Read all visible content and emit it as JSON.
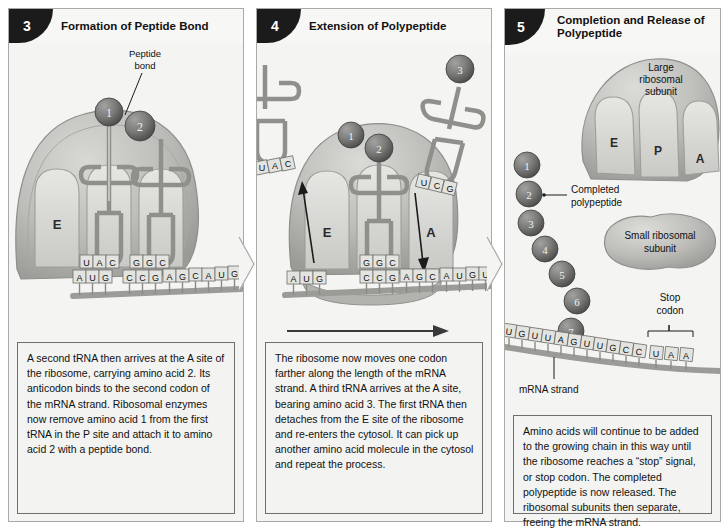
{
  "figure": {
    "colors": {
      "ribosome_fill": "#b9b9b6",
      "ribosome_dark": "#8e8e8a",
      "amino_acid": "#6d6d6d",
      "mrna_strand": "#9b9b97",
      "panel_bg": "#f4f4f2",
      "border": "#6f6f6f",
      "badge": "#1b1b1b",
      "text": "#111111"
    }
  },
  "panels": [
    {
      "number": "3",
      "title": "Formation of Peptide Bond",
      "caption": "A second tRNA then arrives at the A site of the ribosome, carrying amino acid 2. Its anticodon binds to the second codon of the mRNA strand. Ribosomal enzymes now remove amino acid 1 from the first tRNA in the P site and attach it to amino acid 2 with a peptide bond.",
      "labels": {
        "peptide_bond": "Peptide bond",
        "site_e": "E"
      },
      "amino_acids": [
        "1",
        "2"
      ],
      "trna_anticodons": [
        "UAC",
        "GGC"
      ],
      "mrna_bases": [
        "A",
        "U",
        "G",
        "C",
        "C",
        "G",
        "A",
        "G",
        "C",
        "A",
        "U",
        "G"
      ]
    },
    {
      "number": "4",
      "title": "Extension of Polypeptide",
      "caption": "The ribosome now moves one codon farther along the length of the mRNA strand. A third tRNA arrives at the A site, bearing amino acid 3. The first tRNA then detaches from the E site of the ribosome and re-enters the cytosol. It can pick up another amino acid molecule in the cytosol and repeat the process.",
      "labels": {
        "site_e": "E",
        "site_a": "A"
      },
      "amino_acids": [
        "1",
        "2",
        "3"
      ],
      "trna_exiting_anticodon": "UAC",
      "trna_p_anticodon": "GGC",
      "trna_incoming_anticodon": "UCG",
      "mrna_bases": [
        "A",
        "U",
        "G",
        "C",
        "C",
        "G",
        "A",
        "G",
        "C",
        "A",
        "U",
        "G",
        "U"
      ]
    },
    {
      "number": "5",
      "title": "Completion and Release of Polypeptide",
      "caption": "Amino acids will continue to be added to the growing chain in this way until the ribosome reaches a “stop” signal, or stop codon. The completed polypeptide is now released. The ribosomal subunits then separate, freeing the mRNA strand.",
      "labels": {
        "large_subunit": "Large ribosomal subunit",
        "small_subunit": "Small ribosomal subunit",
        "completed_polypeptide": "Completed polypeptide",
        "mrna_strand": "mRNA strand",
        "stop_codon": "Stop codon",
        "site_e": "E",
        "site_p": "P",
        "site_a": "A"
      },
      "amino_acids": [
        "1",
        "2",
        "3",
        "4",
        "5",
        "6",
        "7"
      ],
      "mrna_bases": [
        "U",
        "G",
        "U",
        "U",
        "A",
        "G",
        "U",
        "U",
        "G",
        "C",
        "C",
        "U",
        "A",
        "A"
      ],
      "stop_codon_bases": [
        "U",
        "A",
        "A"
      ]
    }
  ]
}
